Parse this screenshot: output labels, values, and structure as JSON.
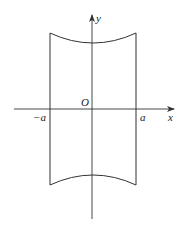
{
  "diagram": {
    "type": "region-plot",
    "axes": {
      "x_label": "x",
      "y_label": "y",
      "origin_label": "O"
    },
    "tick_labels": {
      "neg_a": "−a",
      "pos_a": "a"
    },
    "colors": {
      "stroke": "#333333",
      "background": "#ffffff"
    }
  }
}
